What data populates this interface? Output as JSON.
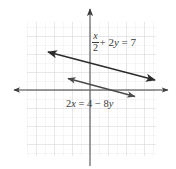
{
  "figure": {
    "background_color": "#ffffff",
    "grid": {
      "visible": true,
      "color": "#d8d8dc",
      "minor_color": "#ebebee",
      "spacing_px": 9,
      "left_px": 27,
      "top_px": 22,
      "right_px": 156,
      "bottom_px": 156
    },
    "axes": {
      "color": "#3b3b3b",
      "x_axis": {
        "y_px": 90,
        "x_start_px": 12,
        "x_end_px": 170,
        "arrowheads": "both"
      },
      "y_axis": {
        "x_px": 90,
        "y_start_px": 7,
        "y_end_px": 166,
        "arrowheads": "top"
      },
      "origin_px": [
        90,
        90
      ]
    },
    "lines": [
      {
        "name": "line-1",
        "equation_text_parts": {
          "numerator": "x",
          "denominator": "2",
          "remainder": "+ 2y = 7"
        },
        "equation_plain": "x/2 + 2y = 7",
        "color": "#2b2b2b",
        "arrowheads": "both",
        "start_px": [
          47,
          52
        ],
        "end_px": [
          156,
          80
        ],
        "label_position_px": [
          92,
          31
        ]
      },
      {
        "name": "line-2",
        "equation_plain": "2x = 4 − 8y",
        "equation_text": "2x = 4 − 8y",
        "color": "#4a4a4a",
        "arrowheads": "both",
        "start_px": [
          67,
          78
        ],
        "end_px": [
          136,
          97
        ],
        "label_position_px": [
          66,
          99
        ]
      }
    ],
    "labels": {
      "equation_1_numerator": "x",
      "equation_1_denominator": "2",
      "equation_1_remainder_plus": "+ 2",
      "equation_1_remainder_var": "y",
      "equation_1_remainder_eq": " = 7",
      "equation_2": "2x = 4 − 8y",
      "equation_2_coef": "2",
      "equation_2_var_x": "x",
      "equation_2_mid": " = 4 − 8",
      "equation_2_var_y": "y"
    }
  }
}
